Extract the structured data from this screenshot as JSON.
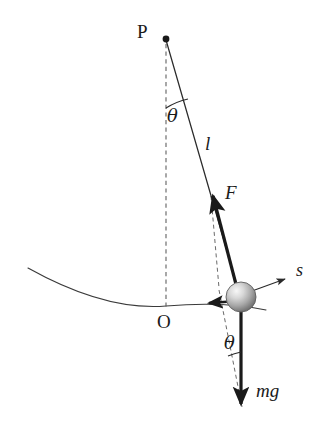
{
  "figure": {
    "background_color": "#ffffff",
    "stroke_color": "#1a1a1a",
    "thin_stroke_color": "#3a3a3a",
    "dash_color": "#555555",
    "bob_fill_light": "#f2f2f2",
    "bob_fill_dark": "#6e6e6e"
  },
  "labels": {
    "pivot": "P",
    "origin": "O",
    "length": "l",
    "tension": "F",
    "arc_coordinate": "s",
    "weight": "mg",
    "angle_top": "θ",
    "angle_bottom": "θ"
  },
  "geometry": {
    "pivot_point": {
      "x": 166,
      "y": 39
    },
    "bob_center": {
      "x": 241,
      "y": 297
    },
    "bob_radius": 15,
    "equilibrium_point": {
      "x": 166,
      "y": 306
    },
    "string_label_point": {
      "x": 210,
      "y": 148
    },
    "tension_arrow_tip": {
      "x": 211,
      "y": 191
    },
    "weight_arrow_tip": {
      "x": 241,
      "y": 412
    },
    "s_arrow_tip": {
      "x": 288,
      "y": 277
    },
    "tangential_arrow_tip": {
      "x": 210,
      "y": 303
    },
    "angle_degrees": 16
  },
  "label_positions": {
    "pivot": {
      "x": 137,
      "y": 24
    },
    "origin": {
      "x": 157,
      "y": 313
    },
    "length": {
      "x": 205,
      "y": 136
    },
    "tension": {
      "x": 224,
      "y": 183
    },
    "arc_coordinate": {
      "x": 296,
      "y": 261
    },
    "weight": {
      "x": 256,
      "y": 391
    },
    "angle_top": {
      "x": 166,
      "y": 106
    },
    "angle_bottom": {
      "x": 223,
      "y": 336
    }
  }
}
